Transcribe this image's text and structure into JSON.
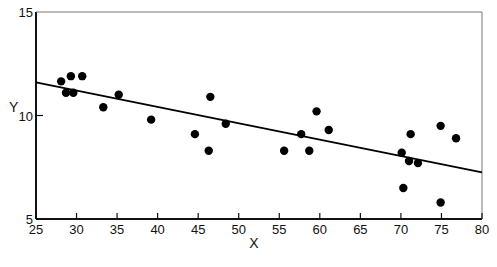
{
  "chart_data": {
    "type": "scatter",
    "title": "",
    "xlabel": "X",
    "ylabel": "Y",
    "xlim": [
      25,
      80
    ],
    "ylim": [
      5,
      15
    ],
    "x_ticks": [
      25,
      30,
      35,
      40,
      45,
      50,
      55,
      60,
      65,
      70,
      75,
      80
    ],
    "y_ticks": [
      5,
      10,
      15
    ],
    "grid": false,
    "legend": null,
    "series": [
      {
        "name": "observations",
        "marker": "filled-circle",
        "color": "#000000",
        "points": [
          {
            "x": 28.1,
            "y": 11.65
          },
          {
            "x": 29.3,
            "y": 11.9
          },
          {
            "x": 30.7,
            "y": 11.9
          },
          {
            "x": 28.7,
            "y": 11.1
          },
          {
            "x": 29.6,
            "y": 11.1
          },
          {
            "x": 33.3,
            "y": 10.4
          },
          {
            "x": 35.2,
            "y": 11.0
          },
          {
            "x": 39.2,
            "y": 9.8
          },
          {
            "x": 44.6,
            "y": 9.1
          },
          {
            "x": 46.5,
            "y": 10.9
          },
          {
            "x": 46.3,
            "y": 8.3
          },
          {
            "x": 48.4,
            "y": 9.6
          },
          {
            "x": 55.6,
            "y": 8.3
          },
          {
            "x": 57.7,
            "y": 9.1
          },
          {
            "x": 58.7,
            "y": 8.3
          },
          {
            "x": 59.6,
            "y": 10.2
          },
          {
            "x": 61.1,
            "y": 9.3
          },
          {
            "x": 70.1,
            "y": 8.2
          },
          {
            "x": 70.3,
            "y": 6.5
          },
          {
            "x": 71.0,
            "y": 7.8
          },
          {
            "x": 71.2,
            "y": 9.1
          },
          {
            "x": 72.1,
            "y": 7.7
          },
          {
            "x": 74.9,
            "y": 9.5
          },
          {
            "x": 74.9,
            "y": 5.8
          },
          {
            "x": 76.8,
            "y": 8.9
          }
        ]
      }
    ],
    "regression_line": {
      "x": [
        25,
        80
      ],
      "y": [
        11.6,
        7.25
      ],
      "color": "#000000"
    }
  }
}
